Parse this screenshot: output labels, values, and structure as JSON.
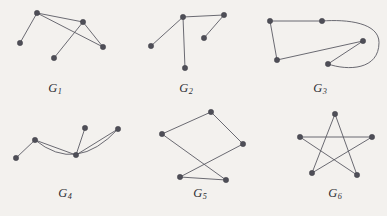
{
  "figure": {
    "width": 387,
    "height": 216,
    "background_color": "#f3f1ee",
    "edge_color": "#5a5a63",
    "vertex_color": "#4e4e57",
    "label_color": "#2e2e33"
  },
  "graphs": [
    {
      "id": "G1",
      "label_text": "G",
      "label_subscript": "1",
      "label_x": 55,
      "label_y": 88,
      "vertex_count": 5,
      "edge_count": 6,
      "vertices": [
        {
          "name": "v1",
          "x": 37,
          "y": 13
        },
        {
          "name": "v2",
          "x": 20,
          "y": 43
        },
        {
          "name": "v3",
          "x": 83,
          "y": 22
        },
        {
          "name": "v4",
          "x": 103,
          "y": 47
        },
        {
          "name": "v5",
          "x": 54,
          "y": 58
        }
      ],
      "edges": [
        {
          "from": 0,
          "to": 1,
          "type": "line"
        },
        {
          "from": 0,
          "to": 2,
          "type": "line"
        },
        {
          "from": 0,
          "to": 3,
          "type": "line"
        },
        {
          "from": 2,
          "to": 3,
          "type": "line"
        },
        {
          "from": 2,
          "to": 4,
          "type": "line"
        },
        {
          "from": 0,
          "to": 4,
          "type": "none"
        }
      ]
    },
    {
      "id": "G2",
      "label_text": "G",
      "label_subscript": "2",
      "label_x": 186,
      "label_y": 88,
      "vertex_count": 5,
      "edge_count": 4,
      "vertices": [
        {
          "name": "v1",
          "x": 183,
          "y": 17
        },
        {
          "name": "v2",
          "x": 224,
          "y": 15
        },
        {
          "name": "v3",
          "x": 151,
          "y": 46
        },
        {
          "name": "v4",
          "x": 204,
          "y": 38
        },
        {
          "name": "v5",
          "x": 185,
          "y": 68
        }
      ],
      "edges": [
        {
          "from": 0,
          "to": 1,
          "type": "line"
        },
        {
          "from": 0,
          "to": 2,
          "type": "line"
        },
        {
          "from": 0,
          "to": 4,
          "type": "line"
        },
        {
          "from": 1,
          "to": 3,
          "type": "line"
        }
      ]
    },
    {
      "id": "G3",
      "label_text": "G",
      "label_subscript": "3",
      "label_x": 320,
      "label_y": 88,
      "vertex_count": 5,
      "edge_count": 5,
      "vertices": [
        {
          "name": "v1",
          "x": 270,
          "y": 21
        },
        {
          "name": "v2",
          "x": 322,
          "y": 21
        },
        {
          "name": "v3",
          "x": 277,
          "y": 60
        },
        {
          "name": "v4",
          "x": 363,
          "y": 41
        },
        {
          "name": "v5",
          "x": 328,
          "y": 64
        }
      ],
      "edges": [
        {
          "from": 0,
          "to": 1,
          "type": "line"
        },
        {
          "from": 0,
          "to": 2,
          "type": "line"
        },
        {
          "from": 2,
          "to": 3,
          "type": "line"
        },
        {
          "from": 3,
          "to": 4,
          "type": "line"
        },
        {
          "from": 1,
          "to": 4,
          "type": "curve-right-loop"
        }
      ]
    },
    {
      "id": "G4",
      "label_text": "G",
      "label_subscript": "4",
      "label_x": 65,
      "label_y": 193,
      "vertex_count": 5,
      "edge_count": 5,
      "vertices": [
        {
          "name": "v1",
          "x": 16,
          "y": 158
        },
        {
          "name": "v2",
          "x": 35,
          "y": 140
        },
        {
          "name": "v3",
          "x": 76,
          "y": 155
        },
        {
          "name": "v4",
          "x": 85,
          "y": 128
        },
        {
          "name": "v5",
          "x": 118,
          "y": 129
        }
      ],
      "edges": [
        {
          "from": 0,
          "to": 1,
          "type": "line"
        },
        {
          "from": 1,
          "to": 2,
          "type": "line"
        },
        {
          "from": 2,
          "to": 3,
          "type": "line"
        },
        {
          "from": 2,
          "to": 4,
          "type": "line"
        },
        {
          "from": 1,
          "to": 4,
          "type": "curve-arc-below"
        }
      ]
    },
    {
      "id": "G5",
      "label_text": "G",
      "label_subscript": "5",
      "label_x": 200,
      "label_y": 193,
      "vertex_count": 5,
      "edge_count": 5,
      "vertices": [
        {
          "name": "v1",
          "x": 211,
          "y": 112
        },
        {
          "name": "v2",
          "x": 162,
          "y": 134
        },
        {
          "name": "v3",
          "x": 243,
          "y": 144
        },
        {
          "name": "v4",
          "x": 180,
          "y": 177
        },
        {
          "name": "v5",
          "x": 226,
          "y": 180
        }
      ],
      "edges": [
        {
          "from": 0,
          "to": 1,
          "type": "line"
        },
        {
          "from": 0,
          "to": 2,
          "type": "line"
        },
        {
          "from": 1,
          "to": 4,
          "type": "line"
        },
        {
          "from": 2,
          "to": 3,
          "type": "line"
        },
        {
          "from": 3,
          "to": 4,
          "type": "line"
        }
      ]
    },
    {
      "id": "G6",
      "label_text": "G",
      "label_subscript": "6",
      "label_x": 335,
      "label_y": 193,
      "vertex_count": 5,
      "edge_count": 5,
      "vertices": [
        {
          "name": "v1",
          "x": 335,
          "y": 114
        },
        {
          "name": "v2",
          "x": 300,
          "y": 137
        },
        {
          "name": "v3",
          "x": 372,
          "y": 137
        },
        {
          "name": "v4",
          "x": 312,
          "y": 173
        },
        {
          "name": "v5",
          "x": 357,
          "y": 175
        }
      ],
      "edges": [
        {
          "from": 0,
          "to": 3,
          "type": "line"
        },
        {
          "from": 0,
          "to": 4,
          "type": "line"
        },
        {
          "from": 1,
          "to": 2,
          "type": "line"
        },
        {
          "from": 1,
          "to": 4,
          "type": "line"
        },
        {
          "from": 2,
          "to": 3,
          "type": "line"
        }
      ]
    }
  ]
}
